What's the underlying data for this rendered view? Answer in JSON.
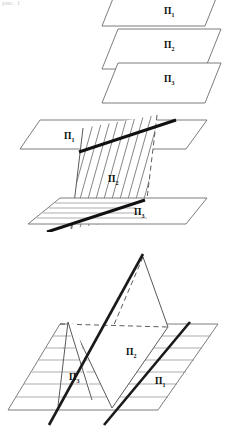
{
  "page": {
    "kind": "scanned-geometry-figure",
    "background_color": "#ffffff",
    "ink_color": "#111111",
    "width_px": 226,
    "height_px": 427,
    "cropped_header_text": "рис. 1"
  },
  "figures": [
    {
      "id": "fig-parallel-planes",
      "caption": "",
      "description": "Three mutually parallel planes drawn as stacked parallelograms",
      "labels": [
        {
          "id": "p1",
          "base": "П",
          "sub": "1",
          "x": 168,
          "y": 13
        },
        {
          "id": "p2",
          "base": "П",
          "sub": "2",
          "x": 165,
          "y": 47
        },
        {
          "id": "p3",
          "base": "П",
          "sub": "3",
          "x": 165,
          "y": 81
        }
      ]
    },
    {
      "id": "fig-two-planes-cut-by-third",
      "caption": "",
      "description": "Two parallel planes cut by a third hatched plane producing two parallel intersection lines",
      "labels": [
        {
          "id": "p1",
          "base": "П",
          "sub": "1",
          "x": 68,
          "y": 137
        },
        {
          "id": "p2",
          "base": "П",
          "sub": "2",
          "x": 112,
          "y": 180
        },
        {
          "id": "p3",
          "base": "П",
          "sub": "3",
          "x": 139,
          "y": 213
        }
      ]
    },
    {
      "id": "fig-two-planes-on-one-plane",
      "caption": "",
      "description": "A horizontal hatched plane intersected by two planes meeting at a common apex, with dashed hidden edges",
      "labels": [
        {
          "id": "p2",
          "base": "П",
          "sub": "2",
          "x": 130,
          "y": 352
        },
        {
          "id": "p3",
          "base": "П",
          "sub": "3",
          "x": 74,
          "y": 377
        },
        {
          "id": "p1",
          "base": "П",
          "sub": "1",
          "x": 159,
          "y": 381
        }
      ]
    }
  ]
}
